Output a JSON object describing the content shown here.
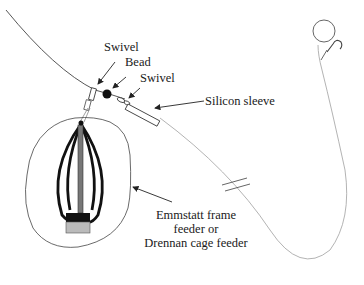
{
  "diagram": {
    "labels": {
      "swivel_top": "Swivel",
      "bead": "Bead",
      "swivel_bottom": "Swivel",
      "silicon_sleeve": "Silicon sleeve",
      "feeder_line1": "Emmstatt frame",
      "feeder_line2": "feeder or",
      "feeder_line3": "Drennan cage feeder"
    },
    "components": [
      "main line",
      "swivel",
      "bead",
      "swivel",
      "silicon sleeve",
      "cage feeder",
      "hook length",
      "break mark",
      "hook with bait"
    ]
  }
}
